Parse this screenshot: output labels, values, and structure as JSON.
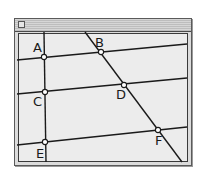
{
  "window": {
    "title": "",
    "close_box": "close-box"
  },
  "diagram": {
    "points": [
      {
        "label": "A",
        "x": 44,
        "y": 57,
        "label_x": 33,
        "label_y": 52
      },
      {
        "label": "B",
        "x": 101,
        "y": 52,
        "label_x": 95,
        "label_y": 47
      },
      {
        "label": "C",
        "x": 45,
        "y": 92,
        "label_x": 33,
        "label_y": 106
      },
      {
        "label": "D",
        "x": 124,
        "y": 85,
        "label_x": 116,
        "label_y": 99
      },
      {
        "label": "E",
        "x": 45,
        "y": 142,
        "label_x": 36,
        "label_y": 158
      },
      {
        "label": "F",
        "x": 158,
        "y": 130,
        "label_x": 155,
        "label_y": 145
      }
    ],
    "lines": [
      {
        "name": "vertical-line",
        "x1": 44,
        "y1": 32,
        "x2": 46,
        "y2": 162
      },
      {
        "name": "diagonal-line",
        "x1": 85,
        "y1": 32,
        "x2": 182,
        "y2": 162
      },
      {
        "name": "line-AB",
        "x1": 17,
        "y1": 60,
        "x2": 187,
        "y2": 44
      },
      {
        "name": "line-CD",
        "x1": 17,
        "y1": 94,
        "x2": 187,
        "y2": 78
      },
      {
        "name": "line-EF",
        "x1": 17,
        "y1": 145,
        "x2": 187,
        "y2": 127
      }
    ],
    "colors": {
      "line": "#1a1a1a",
      "point_fill": "#ffffff",
      "background": "#ececec"
    }
  }
}
